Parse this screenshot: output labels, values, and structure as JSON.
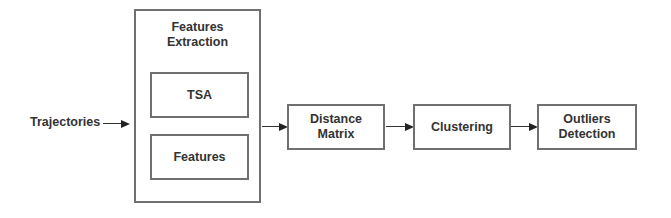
{
  "diagram": {
    "input_label": "Trajectories",
    "feature_extraction": {
      "title": "Features\nExtraction",
      "sub_boxes": [
        {
          "label": "TSA"
        },
        {
          "label": "Features"
        }
      ]
    },
    "pipeline": [
      {
        "label": "Distance\nMatrix"
      },
      {
        "label": "Clustering"
      },
      {
        "label": "Outliers\nDetection"
      }
    ],
    "edges": [
      {
        "from": "Trajectories",
        "to": "Features Extraction"
      },
      {
        "from": "Features Extraction",
        "to": "Distance Matrix"
      },
      {
        "from": "Distance Matrix",
        "to": "Clustering"
      },
      {
        "from": "Clustering",
        "to": "Outliers Detection"
      }
    ],
    "colors": {
      "border": "#707070",
      "text": "#333333",
      "arrow": "#222222",
      "background": "#ffffff"
    }
  }
}
